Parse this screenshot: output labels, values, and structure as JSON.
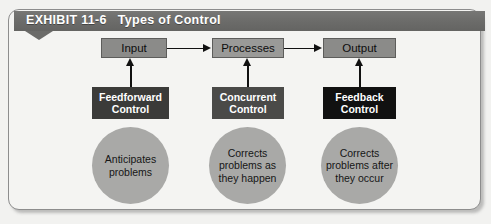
{
  "exhibit": {
    "label": "EXHIBIT 11-6",
    "title": "Types of Control"
  },
  "flow": {
    "stages": [
      {
        "label": "Input"
      },
      {
        "label": "Processes"
      },
      {
        "label": "Output"
      }
    ]
  },
  "controls": [
    {
      "line1": "Feedforward",
      "line2": "Control",
      "color": "#3b3b39",
      "outcome_line1": "Anticipates",
      "outcome_line2": "problems",
      "outcome_line3": ""
    },
    {
      "line1": "Concurrent",
      "line2": "Control",
      "color": "#4a4a48",
      "outcome_line1": "Corrects",
      "outcome_line2": "problems as",
      "outcome_line3": "they happen"
    },
    {
      "line1": "Feedback",
      "line2": "Control",
      "color": "#111111",
      "outcome_line1": "Corrects",
      "outcome_line2": "problems after",
      "outcome_line3": "they occur"
    }
  ],
  "colors": {
    "banner": "#6b6b69",
    "stage_box": "#8b8b89",
    "circle": "#a9a9a7",
    "connector": "#111111",
    "panel_background": "#f4f4f2",
    "panel_border": "#8d8d8d"
  }
}
